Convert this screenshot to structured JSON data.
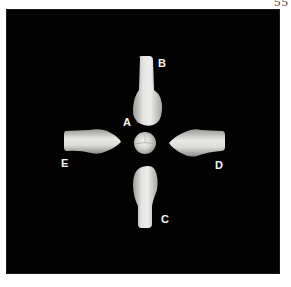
{
  "page": {
    "number": "55"
  },
  "figure": {
    "background": "#020202",
    "labels": {
      "a": "A",
      "b": "B",
      "c": "C",
      "d": "D",
      "e": "E"
    }
  }
}
